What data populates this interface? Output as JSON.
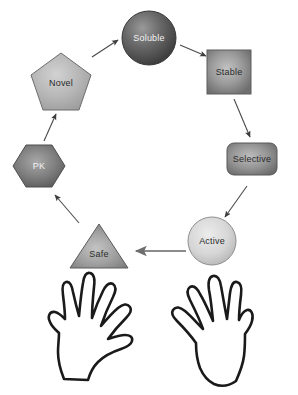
{
  "diagram": {
    "type": "cycle-flow",
    "title": "",
    "background_color": "#ffffff",
    "nodes": [
      {
        "id": "soluble",
        "label": "Soluble",
        "shape": "circle",
        "shape_icon": "circle-icon",
        "fill": "#5e5e5e",
        "stroke": "#3c3c3c",
        "label_color": "#e8e8e8",
        "cx": 149,
        "cy": 38,
        "r": 27
      },
      {
        "id": "stable",
        "label": "Stable",
        "shape": "square",
        "shape_icon": "square-icon",
        "fill": "#8d8d8d",
        "stroke": "#5a5a5a",
        "label_color": "#2b2b2b",
        "cx": 229,
        "cy": 72,
        "size": 44
      },
      {
        "id": "selective",
        "label": "Selective",
        "shape": "rounded-rectangle",
        "shape_icon": "rounded-rectangle-icon",
        "fill": "#8a8a8a",
        "stroke": "#555555",
        "label_color": "#2b2b2b",
        "cx": 252,
        "cy": 159,
        "width": 50,
        "height": 32
      },
      {
        "id": "active",
        "label": "Active",
        "shape": "circle",
        "shape_icon": "circle-icon",
        "fill": "#d3d3d3",
        "stroke": "#707070",
        "label_color": "#2b2b2b",
        "cx": 212,
        "cy": 241,
        "r": 24
      },
      {
        "id": "safe",
        "label": "Safe",
        "shape": "triangle",
        "shape_icon": "triangle-icon",
        "fill": "#949494",
        "stroke": "#5a5a5a",
        "label_color": "#2b2b2b",
        "cx": 99,
        "cy": 246,
        "width": 58,
        "height": 44
      },
      {
        "id": "pk",
        "label": "PK",
        "shape": "hexagon",
        "shape_icon": "hexagon-icon",
        "fill": "#7a7a7a",
        "stroke": "#4d4d4d",
        "label_color": "#e8e8e8",
        "cx": 39,
        "cy": 166,
        "width": 52,
        "height": 46
      },
      {
        "id": "novel",
        "label": "Novel",
        "shape": "pentagon",
        "shape_icon": "pentagon-icon",
        "fill": "#b4b4b4",
        "stroke": "#6b6b6b",
        "label_color": "#2b2b2b",
        "cx": 61,
        "cy": 81,
        "width": 60,
        "height": 56
      }
    ],
    "arrows": [
      {
        "id": "novel-to-soluble",
        "from": "novel",
        "to": "soluble",
        "x1": 92,
        "y1": 57,
        "x2": 118,
        "y2": 40,
        "color": "#4a4a4a"
      },
      {
        "id": "soluble-to-stable",
        "from": "soluble",
        "to": "stable",
        "x1": 180,
        "y1": 45,
        "x2": 205,
        "y2": 56,
        "color": "#4a4a4a"
      },
      {
        "id": "stable-to-selective",
        "from": "stable",
        "to": "selective",
        "x1": 234,
        "y1": 98,
        "x2": 250,
        "y2": 136,
        "color": "#4a4a4a"
      },
      {
        "id": "selective-to-active",
        "from": "selective",
        "to": "active",
        "x1": 246,
        "y1": 185,
        "x2": 224,
        "y2": 216,
        "color": "#4a4a4a"
      },
      {
        "id": "active-to-safe",
        "from": "active",
        "to": "safe",
        "x1": 185,
        "y1": 250,
        "x2": 135,
        "y2": 250,
        "color": "#7b7b7b"
      },
      {
        "id": "safe-to-pk",
        "from": "safe",
        "to": "pk",
        "x1": 79,
        "y1": 222,
        "x2": 54,
        "y2": 194,
        "color": "#4a4a4a"
      },
      {
        "id": "pk-to-novel",
        "from": "pk",
        "to": "novel",
        "x1": 45,
        "y1": 140,
        "x2": 57,
        "y2": 113,
        "color": "#4a4a4a"
      }
    ],
    "hands": [
      {
        "id": "left-hand",
        "label": "left-hand-outline",
        "stroke": "#1a1a1a",
        "fill": "#ffffff"
      },
      {
        "id": "right-hand",
        "label": "right-hand-outline",
        "stroke": "#1a1a1a",
        "fill": "#ffffff"
      }
    ]
  }
}
